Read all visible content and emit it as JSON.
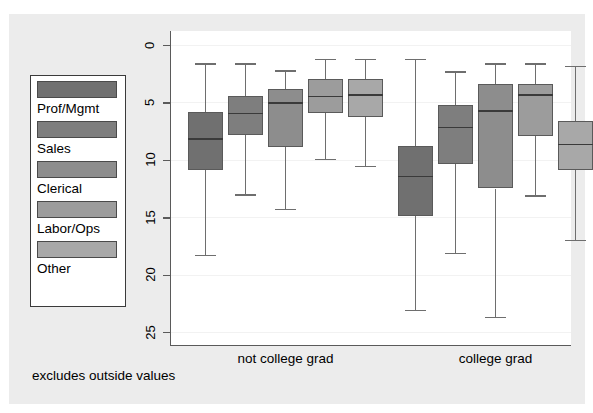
{
  "chart_data": {
    "type": "box",
    "title": "",
    "subtitle": "",
    "xlabel": "",
    "ylabel": "hourly wage",
    "note": "excludes outside values",
    "ylim": [
      0,
      25
    ],
    "y_reversed": true,
    "yticks": [
      0,
      5,
      10,
      15,
      20,
      25
    ],
    "ytick_labels": [
      "0",
      "5",
      "10",
      "15",
      "20",
      "25"
    ],
    "grid": true,
    "legend_position": "left-outside",
    "categories": [
      "not college grad",
      "college grad"
    ],
    "legend": [
      {
        "label": "Prof/Mgmt",
        "color": "#707070"
      },
      {
        "label": "Sales",
        "color": "#7e7e7e"
      },
      {
        "label": "Clerical",
        "color": "#8d8d8d"
      },
      {
        "label": "Labor/Ops",
        "color": "#9c9c9c"
      },
      {
        "label": "Other",
        "color": "#a8a8a8"
      }
    ],
    "series": [
      {
        "name": "Prof/Mgmt",
        "color": "#707070",
        "boxes": [
          {
            "group": "not college grad",
            "lower_whisker": 18.3,
            "q1": 10.9,
            "median": 8.1,
            "q3": 5.8,
            "upper_whisker": 1.6
          },
          {
            "group": "college grad",
            "lower_whisker": 23.1,
            "q1": 14.9,
            "median": 11.4,
            "q3": 8.8,
            "upper_whisker": 1.2
          }
        ]
      },
      {
        "name": "Sales",
        "color": "#7e7e7e",
        "boxes": [
          {
            "group": "not college grad",
            "lower_whisker": 13.0,
            "q1": 7.8,
            "median": 5.9,
            "q3": 4.4,
            "upper_whisker": 1.6
          },
          {
            "group": "college grad",
            "lower_whisker": 18.1,
            "q1": 10.4,
            "median": 7.1,
            "q3": 5.2,
            "upper_whisker": 2.3
          }
        ]
      },
      {
        "name": "Clerical",
        "color": "#8d8d8d",
        "boxes": [
          {
            "group": "not college grad",
            "lower_whisker": 14.3,
            "q1": 8.9,
            "median": 5.0,
            "q3": 3.8,
            "upper_whisker": 2.2
          },
          {
            "group": "college grad",
            "lower_whisker": 23.7,
            "q1": 12.5,
            "median": 5.7,
            "q3": 3.4,
            "upper_whisker": 1.6
          }
        ]
      },
      {
        "name": "Labor/Ops",
        "color": "#9c9c9c",
        "boxes": [
          {
            "group": "not college grad",
            "lower_whisker": 9.9,
            "q1": 5.9,
            "median": 4.4,
            "q3": 3.0,
            "upper_whisker": 1.2
          },
          {
            "group": "college grad",
            "lower_whisker": 13.1,
            "q1": 7.9,
            "median": 4.3,
            "q3": 3.4,
            "upper_whisker": 1.6
          }
        ]
      },
      {
        "name": "Other",
        "color": "#a8a8a8",
        "boxes": [
          {
            "group": "not college grad",
            "lower_whisker": 10.5,
            "q1": 6.3,
            "median": 4.3,
            "q3": 3.0,
            "upper_whisker": 1.2
          },
          {
            "group": "college grad",
            "lower_whisker": 17.0,
            "q1": 10.9,
            "median": 8.6,
            "q3": 6.6,
            "upper_whisker": 1.8
          }
        ]
      }
    ]
  },
  "axis": {
    "y_title": "hourly wage",
    "ticks": [
      "0",
      "5",
      "10",
      "15",
      "20",
      "25"
    ]
  },
  "groups": [
    {
      "label": "not college grad"
    },
    {
      "label": "college grad"
    }
  ],
  "note": {
    "text": "excludes outside values"
  },
  "legend": {
    "items": [
      {
        "label": "Prof/Mgmt",
        "color": "#707070"
      },
      {
        "label": "Sales",
        "color": "#7e7e7e"
      },
      {
        "label": "Clerical",
        "color": "#8d8d8d"
      },
      {
        "label": "Labor/Ops",
        "color": "#9c9c9c"
      },
      {
        "label": "Other",
        "color": "#a8a8a8"
      }
    ]
  }
}
